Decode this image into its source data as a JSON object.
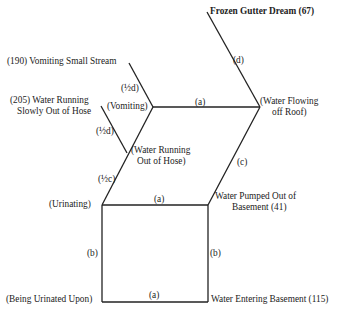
{
  "diagram": {
    "nodes": {
      "frozen_gutter": "Frozen Gutter Dream (67)",
      "vomiting_small_stream": "(190) Vomiting Small Stream",
      "water_running_slowly_1": "(205) Water Running",
      "water_running_slowly_2": "Slowly Out of Hose",
      "vomiting": "(Vomiting)",
      "water_flowing_1": "(Water Flowing",
      "water_flowing_2": "off Roof)",
      "water_running_hose_1": "(Water Running",
      "water_running_hose_2": "Out of Hose)",
      "urinating": "(Urinating)",
      "water_pumped_1": "Water Pumped Out of",
      "water_pumped_2": "Basement (41)",
      "being_urinated": "(Being Urinated Upon)",
      "water_entering": "Water Entering Basement (115)"
    },
    "edges": {
      "d_top": "(d)",
      "half_d_upper": "(½d)",
      "a_top": "(a)",
      "half_d_lower": "(½d)",
      "c_right": "(c)",
      "half_c": "(½c)",
      "a_middle": "(a)",
      "b_left": "(b)",
      "b_right": "(b)",
      "a_bottom": "(a)"
    }
  }
}
